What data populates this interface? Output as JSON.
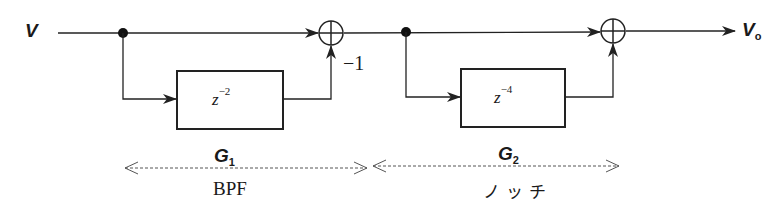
{
  "diagram": {
    "input_signal": {
      "symbol": "V"
    },
    "output_signal": {
      "symbol": "V",
      "subscript": "o"
    },
    "stages": [
      {
        "name": "G",
        "subscript": "1",
        "delay_block": {
          "base": "z",
          "exponent": "−2"
        },
        "summer_feedback_gain": "−1",
        "description": "BPF"
      },
      {
        "name": "G",
        "subscript": "2",
        "delay_block": {
          "base": "z",
          "exponent": "−4"
        },
        "description": "ノッチ"
      }
    ],
    "colors": {
      "line": "#222222",
      "dashed": "#555555",
      "background": "#ffffff"
    }
  }
}
